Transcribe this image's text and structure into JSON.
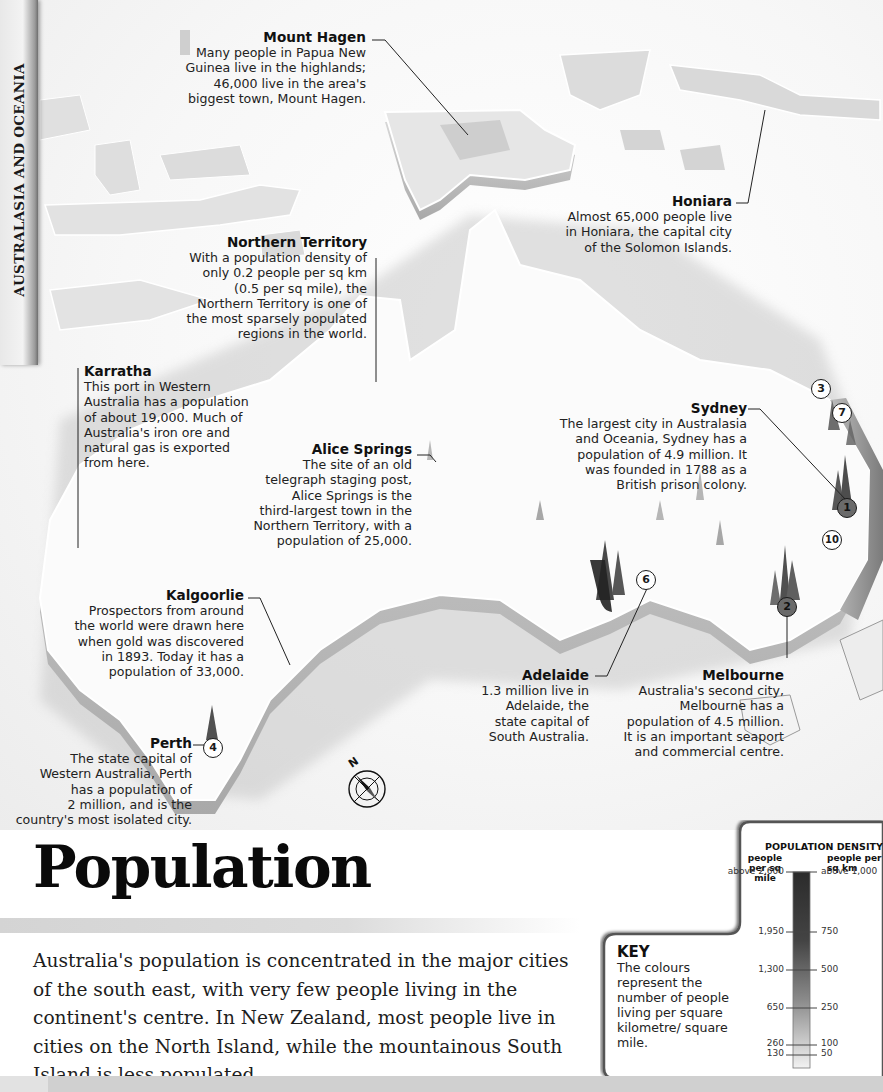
{
  "section_tab": "AUSTRALASIA AND OCEANIA",
  "title": "Population",
  "intro": "Australia's population is concentrated in the major cities of the south east, with very few people living in the continent's centre. In New Zealand, most people live in cities on the North Island, while the mountainous South Island is less populated.",
  "compass": {
    "label": "N"
  },
  "callouts": [
    {
      "id": "mount-hagen",
      "title": "Mount Hagen",
      "body": "Many people in Papua New\nGuinea live in the highlands;\n46,000 live in the area's\nbiggest town, Mount Hagen."
    },
    {
      "id": "honiara",
      "title": "Honiara",
      "body": "Almost 65,000 people live\nin Honiara, the capital city\nof the Solomon Islands."
    },
    {
      "id": "northern-territory",
      "title": "Northern Territory",
      "body": "With a population density of\nonly 0.2 people per sq km\n(0.5 per sq mile), the\nNorthern Territory is one of\nthe most sparsely populated\nregions in the world."
    },
    {
      "id": "karratha",
      "title": "Karratha",
      "body": "This port in Western\nAustralia has a population\nof about 19,000. Much of\nAustralia's iron ore and\nnatural gas is exported\nfrom here."
    },
    {
      "id": "sydney",
      "title": "Sydney",
      "body": "The largest city in Australasia\nand Oceania, Sydney has a\npopulation of 4.9 million. It\nwas founded in 1788 as a\nBritish prison colony."
    },
    {
      "id": "alice-springs",
      "title": "Alice Springs",
      "body": "The site of an old\ntelegraph staging post,\nAlice Springs is the\nthird-largest town in the\nNorthern Territory, with a\npopulation of 25,000."
    },
    {
      "id": "kalgoorlie",
      "title": "Kalgoorlie",
      "body": "Prospectors from around\nthe world were drawn here\nwhen gold was discovered\nin 1893. Today it has a\npopulation of 33,000."
    },
    {
      "id": "adelaide",
      "title": "Adelaide",
      "body": "1.3 million live in\nAdelaide, the\nstate capital of\nSouth Australia."
    },
    {
      "id": "melbourne",
      "title": "Melbourne",
      "body": "Australia's second city,\nMelbourne has a\npopulation of 4.5 million.\nIt is an important seaport\nand commercial centre."
    },
    {
      "id": "perth",
      "title": "Perth",
      "body": "The state capital of\nWestern Australia, Perth\nhas a population of\n2 million, and is the\ncountry's most isolated city."
    }
  ],
  "city_rank_markers": [
    {
      "rank": "1",
      "city": "Sydney"
    },
    {
      "rank": "2",
      "city": "Melbourne"
    },
    {
      "rank": "3",
      "city": "Brisbane area"
    },
    {
      "rank": "4",
      "city": "Perth"
    },
    {
      "rank": "6",
      "city": "Adelaide"
    },
    {
      "rank": "7",
      "city": "Gold Coast area"
    },
    {
      "rank": "10",
      "city": "Canberra area"
    }
  ],
  "key": {
    "heading": "KEY",
    "description": "The colours represent the number of people living per square kilometre/ square mile.",
    "scale_title": "POPULATION DENSITY",
    "left_unit": "people per sq mile",
    "right_unit": "people per sq km",
    "left_ticks": [
      "above 2,600",
      "1,950",
      "1,300",
      "650",
      "260",
      "130"
    ],
    "right_ticks": [
      "above 1,000",
      "750",
      "500",
      "250",
      "100",
      "50"
    ]
  },
  "colors": {
    "text": "#1a1a1a",
    "land": "#f4f4f4",
    "land_edge": "#9a9a9a",
    "dense": "#2a2a2a",
    "sea": "#eeeeee"
  }
}
